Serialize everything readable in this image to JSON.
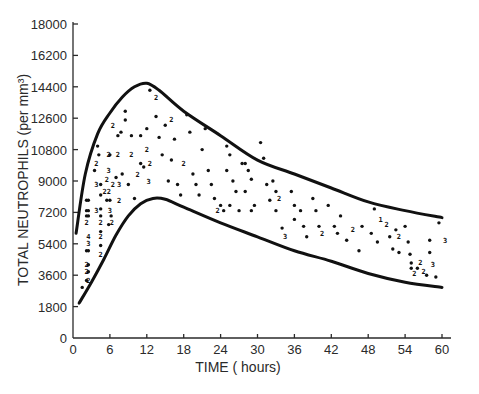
{
  "chart_data": {
    "type": "scatter",
    "title": "",
    "xlabel": "TIME (hours)",
    "ylabel": "TOTAL NEUTROPHILS (per mm³)",
    "xlim": [
      0,
      62
    ],
    "ylim": [
      0,
      18000
    ],
    "x_ticks": [
      0,
      6,
      12,
      18,
      24,
      30,
      36,
      42,
      48,
      54,
      60
    ],
    "y_ticks": [
      0,
      1800,
      3600,
      5400,
      7200,
      9000,
      10800,
      12600,
      14400,
      16200,
      18000
    ],
    "grid": false,
    "legend": null,
    "annotations": "Numerals (2, 3, 4) mark overlapping observations at the same point",
    "series": [
      {
        "name": "upper envelope",
        "kind": "line",
        "x": [
          0.5,
          2,
          4,
          6,
          8,
          10,
          12,
          14,
          18,
          24,
          30,
          36,
          42,
          48,
          54,
          60
        ],
        "y": [
          6000,
          9400,
          11700,
          12900,
          13800,
          14400,
          14600,
          14200,
          13000,
          11600,
          10200,
          9400,
          8600,
          7800,
          7300,
          6900
        ]
      },
      {
        "name": "lower envelope",
        "kind": "line",
        "x": [
          1,
          3,
          5,
          7,
          9,
          11,
          13,
          15,
          18,
          24,
          30,
          36,
          42,
          48,
          54,
          60
        ],
        "y": [
          2000,
          3200,
          4500,
          5900,
          7000,
          7700,
          8000,
          7950,
          7500,
          6600,
          5800,
          5000,
          4400,
          3700,
          3200,
          2900
        ]
      },
      {
        "name": "observations",
        "kind": "scatter",
        "points": [
          [
            1.5,
            2900,
            ""
          ],
          [
            2.2,
            3300,
            ""
          ],
          [
            2.5,
            3300,
            "2"
          ],
          [
            2.2,
            3800,
            "2"
          ],
          [
            2.5,
            3800,
            ""
          ],
          [
            2.2,
            4200,
            "2"
          ],
          [
            2.5,
            4200,
            ""
          ],
          [
            2.2,
            5000,
            ""
          ],
          [
            2.5,
            5000,
            ""
          ],
          [
            2.5,
            5400,
            "3"
          ],
          [
            2.5,
            5800,
            "4"
          ],
          [
            2.2,
            6600,
            "2"
          ],
          [
            2.2,
            7000,
            ""
          ],
          [
            2.5,
            7000,
            ""
          ],
          [
            2.2,
            7300,
            ""
          ],
          [
            2.5,
            7300,
            ""
          ],
          [
            2.2,
            7900,
            ""
          ],
          [
            2.5,
            7900,
            ""
          ],
          [
            4.5,
            4800,
            "2"
          ],
          [
            4.5,
            5300,
            ""
          ],
          [
            4.5,
            5800,
            "2"
          ],
          [
            4.5,
            6100,
            ""
          ],
          [
            4.5,
            6600,
            "2"
          ],
          [
            4.5,
            7000,
            ""
          ],
          [
            4.5,
            7400,
            ""
          ],
          [
            3.8,
            7300,
            "3"
          ],
          [
            4.5,
            8200,
            ""
          ],
          [
            4.5,
            8800,
            ""
          ],
          [
            3.8,
            8800,
            "3"
          ],
          [
            3.5,
            9600,
            ""
          ],
          [
            4.2,
            10500,
            ""
          ],
          [
            3.8,
            10000,
            "2"
          ],
          [
            4.0,
            11000,
            ""
          ],
          [
            5.5,
            7900,
            ""
          ],
          [
            6.0,
            7900,
            ""
          ],
          [
            6.2,
            7000,
            ""
          ],
          [
            5.8,
            6500,
            ""
          ],
          [
            6.3,
            6600,
            "2"
          ],
          [
            6.0,
            7300,
            "3"
          ],
          [
            5.5,
            8400,
            "22"
          ],
          [
            5.5,
            9100,
            "2"
          ],
          [
            5.8,
            9600,
            "3"
          ],
          [
            6.0,
            10500,
            ""
          ],
          [
            5.8,
            10500,
            "2"
          ],
          [
            6.5,
            12200,
            "2"
          ],
          [
            7.5,
            8800,
            "3"
          ],
          [
            7.5,
            7900,
            "2"
          ],
          [
            6.5,
            8800,
            "2"
          ],
          [
            7.0,
            9200,
            ""
          ],
          [
            7.3,
            11600,
            ""
          ],
          [
            7.8,
            11800,
            ""
          ],
          [
            7.3,
            10500,
            "2"
          ],
          [
            8.0,
            9400,
            ""
          ],
          [
            8.5,
            12500,
            ""
          ],
          [
            8.5,
            13000,
            ""
          ],
          [
            9.5,
            11600,
            ""
          ],
          [
            9.5,
            10500,
            "2"
          ],
          [
            9.0,
            8800,
            ""
          ],
          [
            10.0,
            8000,
            ""
          ],
          [
            10.5,
            9400,
            "2"
          ],
          [
            11.0,
            10000,
            ""
          ],
          [
            11.5,
            9800,
            ""
          ],
          [
            11.0,
            11600,
            ""
          ],
          [
            12.0,
            12000,
            ""
          ],
          [
            12.0,
            10800,
            "2"
          ],
          [
            12.5,
            10000,
            "2"
          ],
          [
            12.3,
            9000,
            "3"
          ],
          [
            12.5,
            14200,
            ""
          ],
          [
            13.5,
            13800,
            "2"
          ],
          [
            13.5,
            12700,
            ""
          ],
          [
            14.0,
            11500,
            ""
          ],
          [
            14.5,
            10500,
            ""
          ],
          [
            15.0,
            12200,
            ""
          ],
          [
            16.0,
            12500,
            "2"
          ],
          [
            16.5,
            11400,
            ""
          ],
          [
            16.0,
            10200,
            ""
          ],
          [
            15.5,
            9000,
            ""
          ],
          [
            17.0,
            8800,
            ""
          ],
          [
            17.5,
            8200,
            ""
          ],
          [
            18.5,
            12800,
            ""
          ],
          [
            19.0,
            11800,
            ""
          ],
          [
            18.0,
            10000,
            "2"
          ],
          [
            19.5,
            9400,
            ""
          ],
          [
            20.0,
            8800,
            ""
          ],
          [
            20.5,
            8200,
            ""
          ],
          [
            21.5,
            12000,
            ""
          ],
          [
            21.0,
            10800,
            ""
          ],
          [
            22.0,
            9600,
            ""
          ],
          [
            22.5,
            8800,
            ""
          ],
          [
            23.0,
            8000,
            ""
          ],
          [
            24.0,
            7600,
            ""
          ],
          [
            23.5,
            7300,
            "2"
          ],
          [
            24.5,
            7300,
            ""
          ],
          [
            25.0,
            11000,
            ""
          ],
          [
            25.5,
            10500,
            ""
          ],
          [
            25.0,
            9600,
            ""
          ],
          [
            26.0,
            9000,
            ""
          ],
          [
            26.5,
            8400,
            ""
          ],
          [
            25.5,
            7600,
            ""
          ],
          [
            27.0,
            7300,
            ""
          ],
          [
            27.5,
            10000,
            ""
          ],
          [
            28.0,
            10000,
            ""
          ],
          [
            28.5,
            9600,
            ""
          ],
          [
            29.0,
            9100,
            ""
          ],
          [
            28.0,
            8400,
            ""
          ],
          [
            29.5,
            7600,
            ""
          ],
          [
            29.0,
            7300,
            ""
          ],
          [
            30.5,
            11200,
            ""
          ],
          [
            31.0,
            10300,
            ""
          ],
          [
            31.5,
            8800,
            ""
          ],
          [
            32.0,
            7900,
            ""
          ],
          [
            32.5,
            9000,
            ""
          ],
          [
            33.0,
            8400,
            ""
          ],
          [
            33.5,
            8000,
            "2"
          ],
          [
            33.0,
            7300,
            ""
          ],
          [
            34.0,
            6300,
            ""
          ],
          [
            34.5,
            5800,
            "3"
          ],
          [
            35.5,
            8400,
            ""
          ],
          [
            36.0,
            7600,
            ""
          ],
          [
            36.0,
            6800,
            ""
          ],
          [
            37.0,
            7300,
            ""
          ],
          [
            37.5,
            6400,
            ""
          ],
          [
            38.0,
            5800,
            ""
          ],
          [
            39.0,
            8000,
            ""
          ],
          [
            39.5,
            7300,
            ""
          ],
          [
            40.0,
            6400,
            ""
          ],
          [
            40.5,
            6000,
            "2"
          ],
          [
            41.5,
            7600,
            ""
          ],
          [
            42.5,
            6400,
            ""
          ],
          [
            43.5,
            7000,
            ""
          ],
          [
            43.0,
            6000,
            ""
          ],
          [
            44.5,
            5600,
            ""
          ],
          [
            45.5,
            6200,
            "2"
          ],
          [
            46.5,
            5000,
            ""
          ],
          [
            47.0,
            6400,
            ""
          ],
          [
            48.5,
            6000,
            ""
          ],
          [
            49.0,
            7400,
            ""
          ],
          [
            49.5,
            5500,
            ""
          ],
          [
            50.0,
            6800,
            "1"
          ],
          [
            51.0,
            6500,
            "2"
          ],
          [
            51.5,
            5800,
            ""
          ],
          [
            52.0,
            5100,
            ""
          ],
          [
            52.5,
            6200,
            ""
          ],
          [
            53.0,
            5800,
            "2"
          ],
          [
            53.0,
            4900,
            ""
          ],
          [
            54.0,
            6400,
            ""
          ],
          [
            54.5,
            5500,
            ""
          ],
          [
            54.8,
            4800,
            ""
          ],
          [
            55.0,
            4300,
            ""
          ],
          [
            55.0,
            4000,
            ""
          ],
          [
            55.5,
            3700,
            "2"
          ],
          [
            56.0,
            4000,
            ""
          ],
          [
            56.5,
            4300,
            "2"
          ],
          [
            57.0,
            3800,
            "2"
          ],
          [
            57.5,
            3600,
            ""
          ],
          [
            58.0,
            5600,
            ""
          ],
          [
            58.0,
            4900,
            ""
          ],
          [
            58.5,
            4200,
            "3"
          ],
          [
            59.0,
            3500,
            ""
          ],
          [
            59.5,
            6600,
            ""
          ],
          [
            60.5,
            5600,
            "3"
          ]
        ]
      }
    ]
  },
  "axes": {
    "x_title": "TIME ( hours)",
    "y_title": "TOTAL  NEUTROPHILS  (per mm³)"
  }
}
